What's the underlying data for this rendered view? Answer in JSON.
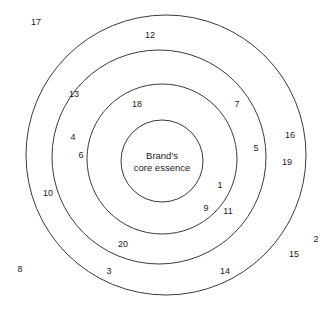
{
  "diagram": {
    "type": "concentric-circles",
    "title": "",
    "center": {
      "label_line1": "Brand's",
      "label_line2": "core essence",
      "cx": 162,
      "cy": 161
    },
    "rings": [
      {
        "name": "ring-outer",
        "cx": 166,
        "cy": 155,
        "r": 140
      },
      {
        "name": "ring-second",
        "cx": 159,
        "cy": 157,
        "r": 107
      },
      {
        "name": "ring-third",
        "cx": 162,
        "cy": 159,
        "r": 75
      },
      {
        "name": "ring-core",
        "cx": 162,
        "cy": 161,
        "r": 41
      }
    ],
    "stroke_color": "#3a3a3a",
    "background_color": "#ffffff",
    "labels": [
      {
        "id": "label-17",
        "text": "17",
        "x": 36,
        "y": 22,
        "zone": "outside"
      },
      {
        "id": "label-12",
        "text": "12",
        "x": 150,
        "y": 35,
        "zone": "band-1"
      },
      {
        "id": "label-13",
        "text": "13",
        "x": 74,
        "y": 94,
        "zone": "band-1"
      },
      {
        "id": "label-18",
        "text": "18",
        "x": 137,
        "y": 104,
        "zone": "band-3"
      },
      {
        "id": "label-7",
        "text": "7",
        "x": 237,
        "y": 104,
        "zone": "band-2"
      },
      {
        "id": "label-16",
        "text": "16",
        "x": 290,
        "y": 135,
        "zone": "outside"
      },
      {
        "id": "label-4",
        "text": "4",
        "x": 73,
        "y": 137,
        "zone": "band-2"
      },
      {
        "id": "label-5",
        "text": "5",
        "x": 256,
        "y": 148,
        "zone": "band-2"
      },
      {
        "id": "label-19",
        "text": "19",
        "x": 287,
        "y": 162,
        "zone": "outside"
      },
      {
        "id": "label-6",
        "text": "6",
        "x": 81,
        "y": 155,
        "zone": "band-2"
      },
      {
        "id": "label-1",
        "text": "1",
        "x": 220,
        "y": 185,
        "zone": "band-3"
      },
      {
        "id": "label-10",
        "text": "10",
        "x": 48,
        "y": 193,
        "zone": "band-1"
      },
      {
        "id": "label-9",
        "text": "9",
        "x": 206,
        "y": 208,
        "zone": "band-3"
      },
      {
        "id": "label-11",
        "text": "11",
        "x": 228,
        "y": 211,
        "zone": "band-2"
      },
      {
        "id": "label-20",
        "text": "20",
        "x": 123,
        "y": 244,
        "zone": "band-2"
      },
      {
        "id": "label-2",
        "text": "2",
        "x": 316,
        "y": 239,
        "zone": "outside"
      },
      {
        "id": "label-15",
        "text": "15",
        "x": 294,
        "y": 254,
        "zone": "outside"
      },
      {
        "id": "label-8",
        "text": "8",
        "x": 20,
        "y": 269,
        "zone": "outside"
      },
      {
        "id": "label-3",
        "text": "3",
        "x": 109,
        "y": 271,
        "zone": "band-1"
      },
      {
        "id": "label-14",
        "text": "14",
        "x": 225,
        "y": 271,
        "zone": "band-1"
      }
    ]
  }
}
